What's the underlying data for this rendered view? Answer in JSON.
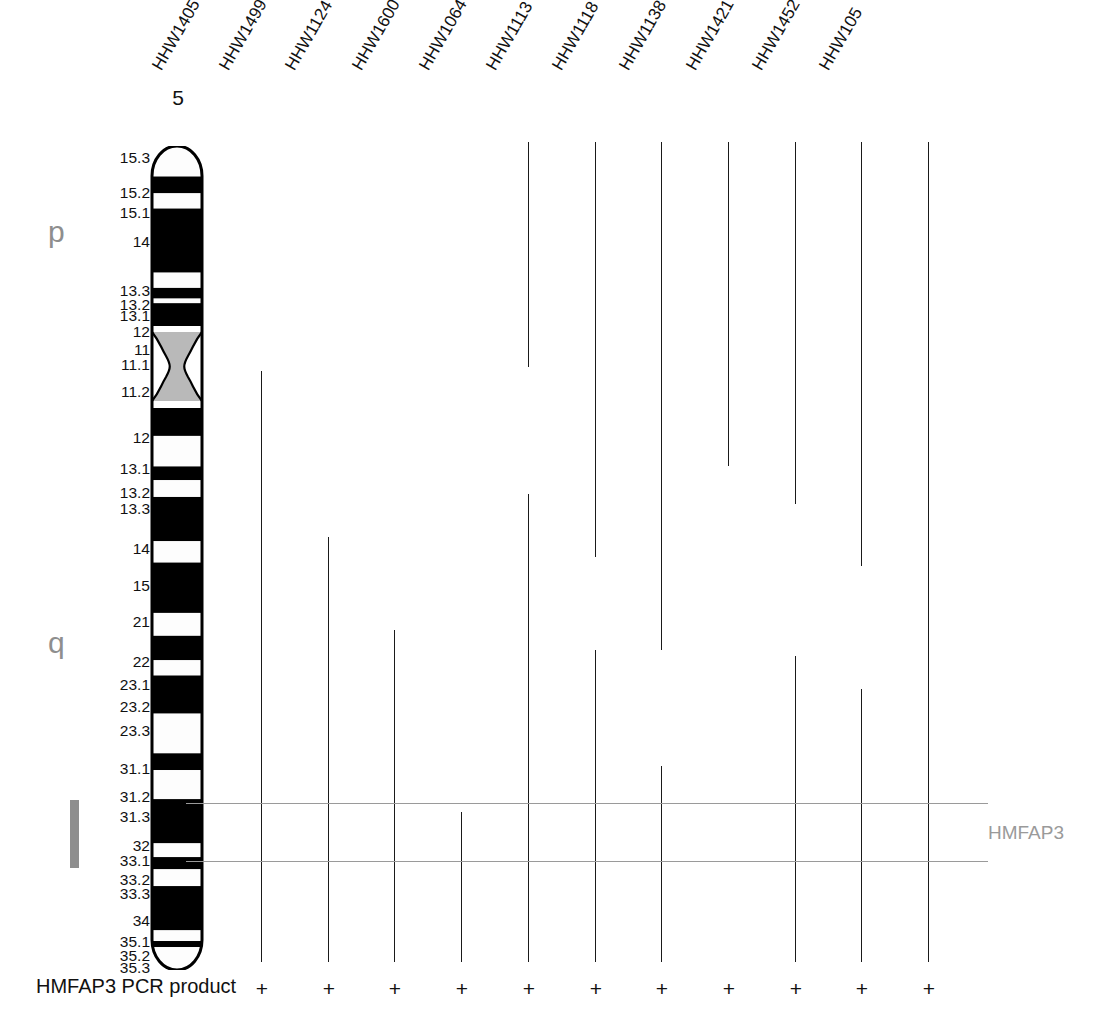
{
  "figure": {
    "chromosome_number": "5",
    "arm_labels": {
      "p": "p",
      "q": "q"
    },
    "locus_label": "HMFAP3",
    "footer_label": "HMFAP3 PCR product",
    "colors": {
      "band_dark": "#000000",
      "band_light": "#fdfdfd",
      "centromere": "#b9b9b9",
      "accent_gray": "#8e8e8e",
      "locus_gray": "#9a9a9a",
      "line_black": "#1a1a1a"
    }
  },
  "band_labels": [
    {
      "text": "15.3",
      "top": 150
    },
    {
      "text": "15.2",
      "top": 185
    },
    {
      "text": "15.1",
      "top": 205
    },
    {
      "text": "14",
      "top": 234
    },
    {
      "text": "13.3",
      "top": 283
    },
    {
      "text": "13.2",
      "top": 297
    },
    {
      "text": "13.1",
      "top": 308
    },
    {
      "text": "12",
      "top": 324
    },
    {
      "text": "11",
      "top": 342
    },
    {
      "text": "11.1",
      "top": 357
    },
    {
      "text": "11.2",
      "top": 384
    },
    {
      "text": "12",
      "top": 430
    },
    {
      "text": "13.1",
      "top": 461
    },
    {
      "text": "13.2",
      "top": 485
    },
    {
      "text": "13.3",
      "top": 501
    },
    {
      "text": "14",
      "top": 541
    },
    {
      "text": "15",
      "top": 578
    },
    {
      "text": "21",
      "top": 614
    },
    {
      "text": "22",
      "top": 654
    },
    {
      "text": "23.1",
      "top": 677
    },
    {
      "text": "23.2",
      "top": 699
    },
    {
      "text": "23.3",
      "top": 723
    },
    {
      "text": "31.1",
      "top": 761
    },
    {
      "text": "31.2",
      "top": 789
    },
    {
      "text": "31.3",
      "top": 809
    },
    {
      "text": "32",
      "top": 838
    },
    {
      "text": "33.1",
      "top": 853
    },
    {
      "text": "33.2",
      "top": 872
    },
    {
      "text": "33.3",
      "top": 886
    },
    {
      "text": "34",
      "top": 913
    },
    {
      "text": "35.1",
      "top": 934
    },
    {
      "text": "35.2",
      "top": 948
    },
    {
      "text": "35.3",
      "top": 960
    }
  ],
  "ideogram_bands": [
    {
      "name": "p15.3",
      "type": "light",
      "top": 0,
      "height": 40,
      "cap": "top"
    },
    {
      "name": "p15.2",
      "type": "dark",
      "top": 40,
      "height": 22
    },
    {
      "name": "p15.1",
      "type": "light",
      "top": 62,
      "height": 20
    },
    {
      "name": "p14",
      "type": "dark",
      "top": 82,
      "height": 84
    },
    {
      "name": "p13.3",
      "type": "light",
      "top": 166,
      "height": 20
    },
    {
      "name": "p13.2",
      "type": "dark",
      "top": 186,
      "height": 14
    },
    {
      "name": "p13.1",
      "type": "light",
      "top": 200,
      "height": 6
    },
    {
      "name": "p12",
      "type": "dark",
      "top": 206,
      "height": 38
    },
    {
      "name": "cen",
      "type": "acen",
      "top": 244,
      "height": 38
    },
    {
      "name": "q11.2",
      "type": "light",
      "top": 282,
      "height": 60
    },
    {
      "name": "q12",
      "type": "dark",
      "top": 342,
      "height": 38
    },
    {
      "name": "q13.1",
      "type": "light",
      "top": 380,
      "height": 40
    },
    {
      "name": "q13.2",
      "type": "dark",
      "top": 420,
      "height": 18
    },
    {
      "name": "q13.3",
      "type": "light",
      "top": 438,
      "height": 22
    },
    {
      "name": "q14",
      "type": "dark",
      "top": 460,
      "height": 58
    },
    {
      "name": "q15",
      "type": "light",
      "top": 518,
      "height": 28
    },
    {
      "name": "q21",
      "type": "dark",
      "top": 546,
      "height": 66
    },
    {
      "name": "q22",
      "type": "light",
      "top": 612,
      "height": 30
    },
    {
      "name": "q23.1",
      "type": "dark",
      "top": 642,
      "height": 32
    },
    {
      "name": "q23.2",
      "type": "light",
      "top": 674,
      "height": 20
    },
    {
      "name": "q23.3",
      "type": "dark",
      "top": 694,
      "height": 50
    },
    {
      "name": "q31.1",
      "type": "light",
      "top": 744,
      "height": 52
    },
    {
      "name": "q31.2",
      "type": "dark",
      "top": 796,
      "height": 22
    },
    {
      "name": "q31.3",
      "type": "light",
      "top": 818,
      "height": 38
    },
    {
      "name": "q32",
      "type": "dark",
      "top": 856,
      "height": 58
    },
    {
      "name": "q33.1",
      "type": "light",
      "top": 914,
      "height": 18
    },
    {
      "name": "q33.2",
      "type": "dark",
      "top": 932,
      "height": 16
    },
    {
      "name": "q33.3",
      "type": "light",
      "top": 948,
      "height": 22
    },
    {
      "name": "q34",
      "type": "dark",
      "top": 970,
      "height": 58
    },
    {
      "name": "q35.1",
      "type": "light",
      "top": 1028,
      "height": 14
    },
    {
      "name": "q35.2",
      "type": "dark",
      "top": 1042,
      "height": 8
    },
    {
      "name": "q35.3",
      "type": "light",
      "top": 1050,
      "height": 30,
      "cap": "bottom"
    }
  ],
  "hybrids": [
    {
      "name": "HHW1405",
      "x": 261,
      "top": 371,
      "bottom": 962,
      "pcr": "+"
    },
    {
      "name": "HHW1499",
      "x": 328,
      "top": 537,
      "bottom": 962,
      "pcr": "+"
    },
    {
      "name": "HHW1124",
      "x": 394,
      "top": 630,
      "bottom": 962,
      "pcr": "+"
    },
    {
      "name": "HHW1600",
      "x": 461,
      "top": 812,
      "bottom": 962,
      "pcr": "+"
    },
    {
      "name": "HHW1064",
      "x": 528,
      "top": 142,
      "bottom": 962,
      "pcr": "+"
    },
    {
      "name": "HHW1113",
      "x": 595,
      "top": 142,
      "bottom": 962,
      "pcr": "+"
    },
    {
      "name": "HHW1118",
      "x": 661,
      "top": 142,
      "bottom": 962,
      "pcr": "+"
    },
    {
      "name": "HHW1138",
      "x": 728,
      "top": 142,
      "bottom": 962,
      "pcr": "+"
    },
    {
      "name": "HHW1421",
      "x": 795,
      "top": 142,
      "bottom": 962,
      "pcr": "+"
    },
    {
      "name": "HHW1452",
      "x": 861,
      "top": 142,
      "bottom": 962,
      "pcr": "+"
    },
    {
      "name": "HHW105",
      "x": 928,
      "top": 142,
      "bottom": 962,
      "pcr": "+"
    }
  ],
  "hybrid_breaks": [
    {
      "name": "HHW1064",
      "x": 528,
      "gap_top": 367,
      "gap_bottom": 494
    },
    {
      "name": "HHW1113",
      "x": 595,
      "gap_top": 557,
      "gap_bottom": 650
    },
    {
      "name": "HHW1118",
      "x": 661,
      "gap_top": 650,
      "gap_bottom": 766
    },
    {
      "name": "HHW1138",
      "x": 728,
      "gap_top": 466,
      "gap_bottom": 962
    },
    {
      "name": "HHW1421",
      "x": 795,
      "gap_top": 504,
      "gap_bottom": 656
    },
    {
      "name": "HHW1452",
      "x": 861,
      "gap_top": 566,
      "gap_bottom": 689
    }
  ],
  "locus_rules": [
    {
      "name": "upper-rule",
      "left": 186,
      "right": 988,
      "top": 803
    },
    {
      "name": "lower-rule",
      "left": 186,
      "right": 988,
      "top": 861
    }
  ]
}
